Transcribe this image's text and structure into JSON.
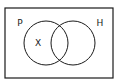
{
  "diagram": {
    "type": "venn",
    "universe": {
      "x": 5,
      "y": 8,
      "width": 108,
      "height": 70
    },
    "sets": [
      {
        "label": "P",
        "cx": 46,
        "cy": 43,
        "r": 22,
        "label_x": 20,
        "label_y": 26
      },
      {
        "label": "H",
        "cx": 73,
        "cy": 43,
        "r": 22,
        "label_x": 100,
        "label_y": 26
      }
    ],
    "elements": [
      {
        "label": "X",
        "x": 38,
        "y": 46,
        "region": "P only"
      }
    ],
    "stroke_color": "#1a1a1a"
  }
}
